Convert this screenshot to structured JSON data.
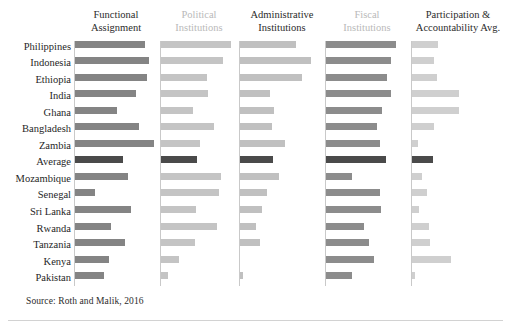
{
  "chart_data": {
    "type": "bar",
    "title": "",
    "subtitle": "",
    "layout": "small-multiples-horizontal-bars",
    "orientation": "horizontal",
    "grid": false,
    "legend": "none",
    "xlabel": "",
    "ylabel": "",
    "xlim": [
      0,
      100
    ],
    "categories": [
      "Philippines",
      "Indonesia",
      "Ethiopia",
      "India",
      "Ghana",
      "Bangladesh",
      "Zambia",
      "Average",
      "Mozambique",
      "Senegal",
      "Sri Lanka",
      "Rwanda",
      "Tanzania",
      "Kenya",
      "Pakistan"
    ],
    "highlight_category": "Average",
    "series": [
      {
        "name": "Functional Assignment",
        "color": "#848484",
        "header_color": "#2b2b2b",
        "values": [
          83,
          88,
          86,
          73,
          50,
          76,
          94,
          57,
          63,
          24,
          67,
          43,
          60,
          40,
          35
        ]
      },
      {
        "name": "Political Institutions",
        "color": "#c4c4c4",
        "header_color": "#b9b9b9",
        "values": [
          90,
          80,
          60,
          61,
          42,
          69,
          50,
          47,
          78,
          75,
          45,
          72,
          44,
          24,
          10
        ]
      },
      {
        "name": "Administrative Institutions",
        "color": "#c0c0c0",
        "header_color": "#2b2b2b",
        "values": [
          66,
          84,
          74,
          36,
          41,
          38,
          53,
          39,
          46,
          32,
          26,
          19,
          24,
          0,
          4
        ]
      },
      {
        "name": "Fiscal Institutions",
        "color": "#8c8c8c",
        "header_color": "#b9b9b9",
        "values": [
          82,
          76,
          72,
          76,
          66,
          60,
          63,
          71,
          31,
          64,
          65,
          45,
          51,
          56,
          30
        ]
      },
      {
        "name": "Participation & Accountability Avg.",
        "color": "#cfcfcf",
        "header_color": "#2b2b2b",
        "values": [
          27,
          23,
          26,
          49,
          49,
          23,
          6,
          22,
          10,
          16,
          7,
          18,
          19,
          41,
          3
        ]
      }
    ]
  },
  "headers": [
    {
      "line1": "Functional",
      "line2": "Assignment"
    },
    {
      "line1": "Political",
      "line2": "Institutions"
    },
    {
      "line1": "Administrative",
      "line2": "Institutions"
    },
    {
      "line1": "Fiscal",
      "line2": "Institutions"
    },
    {
      "line1": "Participation &",
      "line2": "Accountability Avg."
    }
  ],
  "footer": {
    "source": "Source: Roth and Malik, 2016"
  },
  "style": {
    "bar_color_default": "#a6a6a6",
    "bar_color_highlight": "#4a4a4a",
    "axis_color": "#c9c9c9",
    "background": "#ffffff"
  }
}
